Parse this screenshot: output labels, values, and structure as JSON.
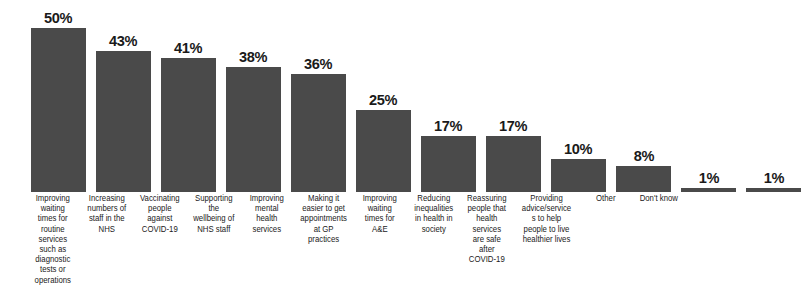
{
  "chart_data": {
    "type": "bar",
    "title": "",
    "subtitle": "",
    "xlabel": "",
    "ylabel": "",
    "ylim": [
      0,
      50
    ],
    "grid": false,
    "legend": false,
    "orientation": "vertical",
    "value_suffix": "%",
    "bar_color": "#4a4a4a",
    "background_color": "#ffffff",
    "label_color": "#1a1a1a",
    "categories": [
      "Improving waiting times for routine services such as diagnostic tests or operations",
      "Increasing numbers of staff in the NHS",
      "Vaccinating people against COVID-19",
      "Supporting the wellbeing of NHS staff",
      "Improving mental health services",
      "Making it easier to get appointments at GP practices",
      "Improving waiting times for A&E",
      "Reducing inequalities in health in society",
      "Reassuring people that health services are safe after COVID-19",
      "Providing advice/services to help people to live healthier lives",
      "Other",
      "Don't know"
    ],
    "values": [
      50,
      43,
      41,
      38,
      36,
      25,
      17,
      17,
      10,
      8,
      1,
      1
    ],
    "value_labels": [
      "50%",
      "43%",
      "41%",
      "38%",
      "36%",
      "25%",
      "17%",
      "17%",
      "10%",
      "8%",
      "1%",
      "1%"
    ],
    "bars": [
      {
        "category": "Improving waiting times for routine services such as diagnostic tests or operations",
        "value": 50,
        "value_label": "50%"
      },
      {
        "category": "Increasing numbers of staff in the NHS",
        "value": 43,
        "value_label": "43%"
      },
      {
        "category": "Vaccinating people against COVID-19",
        "value": 41,
        "value_label": "41%"
      },
      {
        "category": "Supporting the wellbeing of NHS staff",
        "value": 38,
        "value_label": "38%"
      },
      {
        "category": "Improving mental health services",
        "value": 36,
        "value_label": "36%"
      },
      {
        "category": "Making it easier to get appointments at GP practices",
        "value": 25,
        "value_label": "25%"
      },
      {
        "category": "Improving waiting times for A&E",
        "value": 17,
        "value_label": "17%"
      },
      {
        "category": "Reducing inequalities in health in society",
        "value": 17,
        "value_label": "17%"
      },
      {
        "category": "Reassuring people that health services are safe after COVID-19",
        "value": 10,
        "value_label": "10%"
      },
      {
        "category": "Providing advice/services to help people to live healthier lives",
        "value": 8,
        "value_label": "8%"
      },
      {
        "category": "Other",
        "value": 1,
        "value_label": "1%"
      },
      {
        "category": "Don't know",
        "value": 1,
        "value_label": "1%"
      }
    ]
  }
}
